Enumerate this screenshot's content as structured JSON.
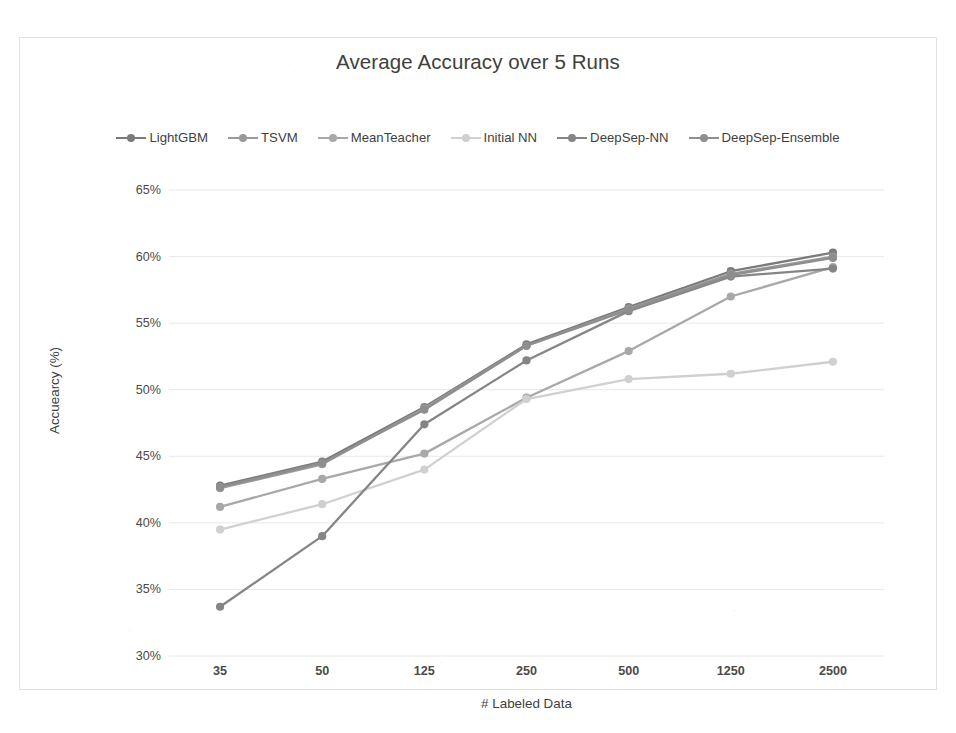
{
  "chart_data": {
    "type": "line",
    "title": "Average Accuracy over 5 Runs",
    "xlabel": "# Labeled Data",
    "ylabel": "Accuearcy (%)",
    "categories": [
      "35",
      "50",
      "125",
      "250",
      "500",
      "1250",
      "2500"
    ],
    "ylim": [
      30,
      65
    ],
    "ytick_step": 5,
    "ytick_labels": [
      "65%",
      "60%",
      "55%",
      "50%",
      "45%",
      "40%",
      "35%",
      "30%"
    ],
    "ytick_values": [
      65,
      60,
      55,
      50,
      45,
      40,
      35,
      30
    ],
    "grid": true,
    "legend_position": "top",
    "value_suffix": "%",
    "series": [
      {
        "name": "LightGBM",
        "color": "#7b7b7b",
        "values": [
          42.8,
          44.6,
          48.7,
          53.4,
          56.2,
          58.9,
          60.3
        ]
      },
      {
        "name": "TSVM",
        "color": "#9a9a9a",
        "values": [
          42.6,
          44.4,
          48.6,
          53.3,
          56.1,
          58.7,
          60.0
        ]
      },
      {
        "name": "MeanTeacher",
        "color": "#a8a8a8",
        "values": [
          41.2,
          43.3,
          45.2,
          49.4,
          52.9,
          57.0,
          59.2
        ]
      },
      {
        "name": "Initial NN",
        "color": "#d0d0d0",
        "values": [
          39.5,
          41.4,
          44.0,
          49.3,
          50.8,
          51.2,
          52.1
        ]
      },
      {
        "name": "DeepSep-NN",
        "color": "#858585",
        "values": [
          33.7,
          39.0,
          47.4,
          52.2,
          55.9,
          58.5,
          59.1
        ]
      },
      {
        "name": "DeepSep-Ensemble",
        "color": "#8e8e8e",
        "values": [
          42.7,
          44.5,
          48.5,
          53.3,
          56.0,
          58.6,
          59.9
        ]
      }
    ]
  }
}
